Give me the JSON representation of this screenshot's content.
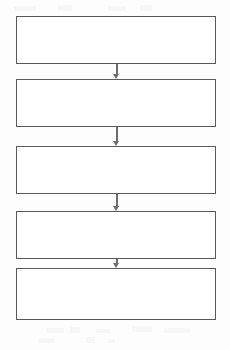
{
  "diagram": {
    "type": "flowchart",
    "title": "",
    "orientation": "vertical",
    "canvas": {
      "width": 230,
      "height": 350
    },
    "style": {
      "page_background": "#fdfdfd",
      "node_fill": "#ffffff",
      "node_border_color": "#5a5a5a",
      "node_border_width_px": 1.5,
      "connector_color": "#6e6e6e"
    },
    "nodes": [
      {
        "id": "node-1",
        "label": "",
        "x": 16,
        "y": 16,
        "width": 200,
        "height": 48
      },
      {
        "id": "node-2",
        "label": "",
        "x": 16,
        "y": 79,
        "width": 200,
        "height": 48
      },
      {
        "id": "node-3",
        "label": "",
        "x": 16,
        "y": 146,
        "width": 200,
        "height": 48
      },
      {
        "id": "node-4",
        "label": "",
        "x": 16,
        "y": 211,
        "width": 200,
        "height": 48
      },
      {
        "id": "node-5",
        "label": "",
        "x": 16,
        "y": 268,
        "width": 200,
        "height": 52
      }
    ],
    "connectors": [
      {
        "id": "arrow-1",
        "from": "node-1",
        "to": "node-2",
        "label": "",
        "x": 111,
        "y": 64,
        "length": 15,
        "arrowhead": "solid-triangle-down"
      },
      {
        "id": "arrow-2",
        "from": "node-2",
        "to": "node-3",
        "label": "",
        "x": 111,
        "y": 127,
        "length": 19,
        "arrowhead": "solid-triangle-down"
      },
      {
        "id": "arrow-3",
        "from": "node-3",
        "to": "node-4",
        "label": "",
        "x": 111,
        "y": 194,
        "length": 17,
        "arrowhead": "solid-triangle-down"
      },
      {
        "id": "arrow-4",
        "from": "node-4",
        "to": "node-5",
        "label": "",
        "x": 111,
        "y": 259,
        "length": 9,
        "arrowhead": "solid-triangle-down"
      }
    ]
  }
}
